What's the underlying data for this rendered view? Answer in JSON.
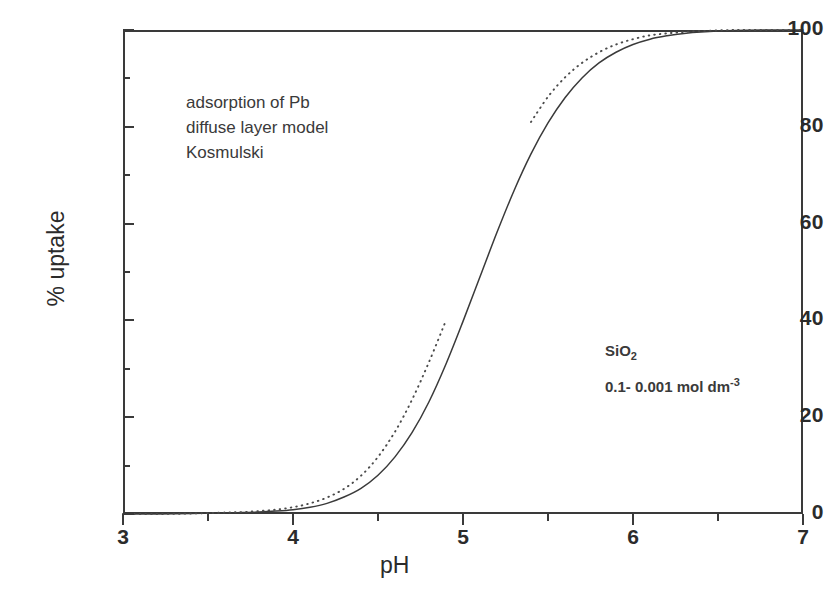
{
  "figure": {
    "background_color": "#ffffff",
    "ink_color": "#2b2b2b"
  },
  "annotations": {
    "model": {
      "line1": "adsorption of Pb",
      "line2": "diffuse layer model",
      "line3": "Kosmulski"
    },
    "sample": {
      "compound_base": "SiO",
      "compound_sub": "2",
      "concentration_text": "0.1- 0.001 mol dm",
      "concentration_sup": "-3"
    }
  },
  "chart_data": {
    "type": "line",
    "title": "",
    "subtitle": "",
    "xlabel": "pH",
    "ylabel": "% uptake",
    "xlim": [
      3,
      7
    ],
    "ylim": [
      0,
      100
    ],
    "grid": false,
    "legend_position": "none",
    "x_ticks_major": [
      3,
      4,
      5,
      6,
      7
    ],
    "x_ticks_major_labels": [
      "3",
      "4",
      "5",
      "6",
      "7"
    ],
    "x_ticks_minor": [
      3.5,
      4.5,
      5.5,
      6.5
    ],
    "y_ticks_major": [
      0,
      20,
      40,
      60,
      80,
      100
    ],
    "y_ticks_major_labels": [
      "0",
      "20",
      "40",
      "60",
      "80",
      "100"
    ],
    "y_ticks_minor": [
      10,
      30,
      50,
      70,
      90
    ],
    "annotations": [
      "adsorption of Pb",
      "diffuse layer model",
      "Kosmulski",
      "SiO2",
      "0.1- 0.001 mol dm-3"
    ],
    "series": [
      {
        "name": "solid-curve",
        "style": "solid",
        "color": "#3a3a3a",
        "width": 1.4,
        "x": [
          3.0,
          3.2,
          3.4,
          3.6,
          3.7,
          3.8,
          3.9,
          4.0,
          4.1,
          4.2,
          4.3,
          4.4,
          4.5,
          4.6,
          4.7,
          4.8,
          4.9,
          5.0,
          5.1,
          5.2,
          5.3,
          5.4,
          5.5,
          5.6,
          5.7,
          5.8,
          5.9,
          6.0,
          6.1,
          6.2,
          6.3,
          6.4,
          6.6,
          6.8,
          7.0
        ],
        "y": [
          0.0,
          0.0,
          0.1,
          0.2,
          0.3,
          0.4,
          0.6,
          0.9,
          1.4,
          2.2,
          3.5,
          5.3,
          8.0,
          11.8,
          16.8,
          23.2,
          31.0,
          39.8,
          49.0,
          58.2,
          66.8,
          74.4,
          80.8,
          86.0,
          90.1,
          93.2,
          95.4,
          97.0,
          98.1,
          98.8,
          99.3,
          99.6,
          99.9,
          100.0,
          100.0
        ]
      },
      {
        "name": "dotted-curve",
        "style": "dotted",
        "color": "#4a4a4a",
        "width": 1.4,
        "gap_x_range": [
          4.92,
          5.36
        ],
        "x": [
          3.0,
          3.2,
          3.4,
          3.6,
          3.7,
          3.8,
          3.9,
          4.0,
          4.1,
          4.2,
          4.3,
          4.4,
          4.5,
          4.6,
          4.7,
          4.8,
          4.9,
          5.0,
          5.1,
          5.2,
          5.3,
          5.4,
          5.5,
          5.6,
          5.7,
          5.8,
          5.9,
          6.0,
          6.1,
          6.2,
          6.3,
          6.4,
          6.6,
          6.8,
          7.0
        ],
        "y": [
          0.0,
          0.0,
          0.1,
          0.3,
          0.4,
          0.6,
          0.9,
          1.4,
          2.2,
          3.4,
          5.2,
          7.9,
          11.8,
          17.0,
          23.6,
          31.4,
          40.0,
          49.2,
          58.4,
          67.0,
          74.6,
          81.0,
          86.2,
          90.2,
          93.2,
          95.4,
          97.0,
          98.1,
          98.9,
          99.3,
          99.6,
          99.8,
          100.0,
          100.0,
          100.0
        ]
      }
    ]
  }
}
